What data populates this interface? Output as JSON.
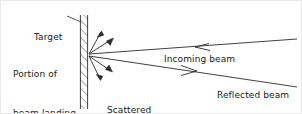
{
  "figure": {
    "type": "physics-beam-scattering-diagram",
    "background_color": "#ffffff",
    "line_color": "#2b2b2b",
    "text_color": "#1a1a1a"
  },
  "labels": {
    "target": "Target",
    "portion_line1": "Portion of",
    "portion_line2": "beam landing",
    "scattered_line1": "Scattered",
    "scattered_line2": "portion",
    "incoming": "Incoming beam",
    "reflected": "Reflected beam"
  },
  "geometry": {
    "target_wall": {
      "x_left": 79,
      "x_right": 87,
      "y_top": 14,
      "y_bottom": 108,
      "hatch": "diagonal-up-right"
    },
    "impact_point": {
      "x": 87,
      "y": 54
    },
    "incoming_beam": {
      "from": {
        "x": 296,
        "y": 38
      },
      "to": {
        "x": 88,
        "y": 53
      },
      "arrow_at": {
        "x": 199,
        "y": 46
      },
      "arrow_direction": "left"
    },
    "reflected_beam": {
      "from": {
        "x": 88,
        "y": 55
      },
      "to": {
        "x": 296,
        "y": 86
      },
      "arrow_at": {
        "x": 188,
        "y": 70
      },
      "arrow_direction": "right"
    },
    "target_leader": {
      "from": {
        "x": 66,
        "y": 15
      },
      "to": {
        "x": 80,
        "y": 21
      }
    },
    "scattered_arrows": [
      {
        "angle_deg": 62,
        "length": 26
      },
      {
        "angle_deg": 38,
        "length": 31
      },
      {
        "angle_deg": -34,
        "length": 26
      },
      {
        "angle_deg": -58,
        "length": 28
      }
    ]
  }
}
